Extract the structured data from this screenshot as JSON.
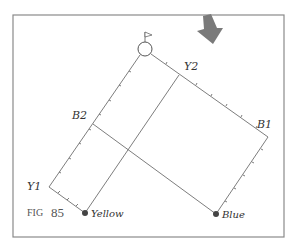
{
  "figure": {
    "caption_prefix": "FIG",
    "caption_number": "85"
  },
  "labels": {
    "y1": "Y1",
    "y2": "Y2",
    "b1": "B1",
    "b2": "B2",
    "yellow": "Yellow",
    "blue": "Blue"
  },
  "points": {
    "flag_hole": [
      145,
      49
    ],
    "y1": [
      49,
      187
    ],
    "y2": [
      179,
      75
    ],
    "b1": [
      268,
      137
    ],
    "b2": [
      93,
      124
    ],
    "yellow": [
      85,
      213
    ],
    "blue": [
      216,
      214
    ]
  },
  "colors": {
    "frame": "#8a8a8a",
    "line": "#6e6e6e",
    "arrow": "#7a7a7a",
    "dot": "#444444",
    "text": "#333333"
  },
  "icons": {
    "arrow": "down-arrow-icon",
    "flag": "flag-icon"
  }
}
